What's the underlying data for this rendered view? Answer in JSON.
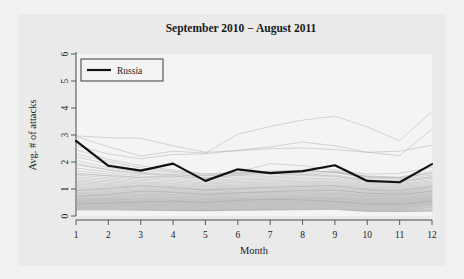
{
  "chart_data": {
    "type": "line",
    "title": "September 2010 − August 2011",
    "xlabel": "Month",
    "ylabel": "Avg. # of attacks",
    "xlim": [
      1,
      12
    ],
    "ylim": [
      0,
      6
    ],
    "xticks": [
      "1",
      "2",
      "3",
      "4",
      "5",
      "6",
      "7",
      "8",
      "9",
      "10",
      "11",
      "12"
    ],
    "yticks": [
      "0",
      "1",
      "2",
      "3",
      "4",
      "5",
      "6"
    ],
    "grid": false,
    "legend": {
      "position": "top-left",
      "entries": [
        {
          "label": "Russia",
          "color": "#111111",
          "width": 2.2
        }
      ]
    },
    "x": [
      1,
      2,
      3,
      4,
      5,
      6,
      7,
      8,
      9,
      10,
      11,
      12
    ],
    "highlight_color": "#111111",
    "background_color": "#eaeaea",
    "plot_background_color": "#f4f4f4",
    "other_series_color": "#9a9a9a",
    "series": [
      {
        "name": "Russia",
        "highlight": true,
        "values": [
          2.78,
          1.86,
          1.68,
          1.94,
          1.3,
          1.73,
          1.59,
          1.66,
          1.88,
          1.3,
          1.25,
          1.92
        ]
      },
      {
        "name": "other-01",
        "highlight": false,
        "values": [
          2.97,
          2.9,
          2.88,
          2.6,
          2.36,
          2.42,
          2.49,
          2.52,
          2.46,
          2.36,
          2.24,
          3.22
        ]
      },
      {
        "name": "other-02",
        "highlight": false,
        "values": [
          2.95,
          2.56,
          2.22,
          2.4,
          2.33,
          3.03,
          3.32,
          3.55,
          3.7,
          3.3,
          2.79,
          3.87
        ]
      },
      {
        "name": "other-03",
        "highlight": false,
        "values": [
          2.6,
          2.3,
          2.12,
          2.28,
          2.3,
          2.43,
          2.56,
          2.74,
          2.6,
          2.36,
          2.4,
          2.62
        ]
      },
      {
        "name": "other-04",
        "highlight": false,
        "values": [
          2.45,
          2.1,
          1.86,
          1.7,
          1.56,
          1.62,
          1.94,
          1.86,
          1.7,
          1.55,
          1.58,
          1.8
        ]
      },
      {
        "name": "other-05",
        "highlight": false,
        "values": [
          2.2,
          1.92,
          1.7,
          1.62,
          1.48,
          1.55,
          1.6,
          1.62,
          1.66,
          1.46,
          1.42,
          1.6
        ]
      },
      {
        "name": "other-06",
        "highlight": false,
        "values": [
          2.05,
          1.8,
          1.62,
          1.55,
          1.42,
          1.5,
          1.52,
          1.55,
          1.6,
          1.4,
          1.36,
          1.52
        ]
      },
      {
        "name": "other-07",
        "highlight": false,
        "values": [
          1.9,
          1.7,
          1.55,
          1.48,
          1.38,
          1.44,
          1.46,
          1.5,
          1.52,
          1.34,
          1.3,
          1.46
        ]
      },
      {
        "name": "other-08",
        "highlight": false,
        "values": [
          1.78,
          1.62,
          1.48,
          1.42,
          1.32,
          1.38,
          1.41,
          1.44,
          1.46,
          1.29,
          1.26,
          1.4
        ]
      },
      {
        "name": "other-09",
        "highlight": false,
        "values": [
          1.68,
          1.55,
          1.42,
          1.36,
          1.27,
          1.33,
          1.36,
          1.38,
          1.4,
          1.24,
          1.21,
          1.35
        ]
      },
      {
        "name": "other-10",
        "highlight": false,
        "values": [
          1.6,
          1.48,
          1.36,
          1.31,
          1.22,
          1.28,
          1.31,
          1.33,
          1.35,
          1.2,
          1.17,
          1.3
        ]
      },
      {
        "name": "other-11",
        "highlight": false,
        "values": [
          1.52,
          1.42,
          1.31,
          1.26,
          1.18,
          1.24,
          1.26,
          1.28,
          1.3,
          1.16,
          1.13,
          1.26
        ]
      },
      {
        "name": "other-12",
        "highlight": false,
        "values": [
          1.45,
          1.36,
          1.26,
          1.21,
          1.14,
          1.19,
          1.22,
          1.24,
          1.26,
          1.12,
          1.09,
          1.22
        ]
      },
      {
        "name": "other-13",
        "highlight": false,
        "values": [
          1.39,
          1.31,
          1.22,
          1.17,
          1.1,
          1.15,
          1.18,
          1.2,
          1.22,
          1.08,
          1.06,
          1.18
        ]
      },
      {
        "name": "other-14",
        "highlight": false,
        "values": [
          1.33,
          1.26,
          1.18,
          1.13,
          1.07,
          1.11,
          1.14,
          1.16,
          1.18,
          1.05,
          1.02,
          1.14
        ]
      },
      {
        "name": "other-15",
        "highlight": false,
        "values": [
          1.28,
          1.21,
          1.14,
          1.09,
          1.03,
          1.08,
          1.1,
          1.12,
          1.14,
          1.01,
          0.99,
          1.11
        ]
      },
      {
        "name": "other-16",
        "highlight": false,
        "values": [
          1.23,
          1.17,
          1.1,
          1.06,
          1.0,
          1.04,
          1.07,
          1.09,
          1.11,
          0.98,
          0.96,
          1.07
        ]
      },
      {
        "name": "other-17",
        "highlight": false,
        "values": [
          1.18,
          1.13,
          1.06,
          1.02,
          0.97,
          1.01,
          1.03,
          1.05,
          1.07,
          0.95,
          0.93,
          1.04
        ]
      },
      {
        "name": "other-18",
        "highlight": false,
        "values": [
          1.13,
          1.09,
          1.03,
          0.99,
          0.94,
          0.98,
          1.0,
          1.02,
          1.04,
          0.92,
          0.9,
          1.01
        ]
      },
      {
        "name": "other-19",
        "highlight": false,
        "values": [
          1.09,
          1.05,
          0.99,
          0.96,
          0.91,
          0.95,
          0.97,
          0.99,
          1.01,
          0.89,
          0.87,
          0.98
        ]
      },
      {
        "name": "other-20",
        "highlight": false,
        "values": [
          1.05,
          1.01,
          0.96,
          0.93,
          0.88,
          0.92,
          0.94,
          0.96,
          0.98,
          0.86,
          0.85,
          0.95
        ]
      },
      {
        "name": "other-21",
        "highlight": false,
        "values": [
          1.01,
          0.98,
          0.93,
          0.9,
          0.85,
          0.89,
          0.91,
          0.93,
          0.95,
          0.84,
          0.82,
          0.92
        ]
      },
      {
        "name": "other-22",
        "highlight": false,
        "values": [
          0.97,
          0.94,
          0.9,
          0.87,
          0.83,
          0.86,
          0.88,
          0.9,
          0.92,
          0.81,
          0.8,
          0.89
        ]
      },
      {
        "name": "other-23",
        "highlight": false,
        "values": [
          0.94,
          0.91,
          0.87,
          0.84,
          0.8,
          0.84,
          0.86,
          0.87,
          0.89,
          0.79,
          0.77,
          0.87
        ]
      },
      {
        "name": "other-24",
        "highlight": false,
        "values": [
          0.9,
          0.88,
          0.84,
          0.81,
          0.78,
          0.81,
          0.83,
          0.85,
          0.86,
          0.76,
          0.75,
          0.84
        ]
      },
      {
        "name": "other-25",
        "highlight": false,
        "values": [
          0.87,
          0.85,
          0.81,
          0.79,
          0.75,
          0.79,
          0.8,
          0.82,
          0.84,
          0.74,
          0.73,
          0.81
        ]
      },
      {
        "name": "other-26",
        "highlight": false,
        "values": [
          0.84,
          0.82,
          0.79,
          0.76,
          0.73,
          0.76,
          0.78,
          0.79,
          0.81,
          0.72,
          0.7,
          0.79
        ]
      },
      {
        "name": "other-27",
        "highlight": false,
        "values": [
          0.81,
          0.79,
          0.76,
          0.74,
          0.71,
          0.74,
          0.75,
          0.77,
          0.79,
          0.7,
          0.68,
          0.77
        ]
      },
      {
        "name": "other-28",
        "highlight": false,
        "values": [
          0.78,
          0.76,
          0.74,
          0.71,
          0.68,
          0.71,
          0.73,
          0.75,
          0.76,
          0.67,
          0.66,
          0.74
        ]
      },
      {
        "name": "other-29",
        "highlight": false,
        "values": [
          0.75,
          0.74,
          0.71,
          0.69,
          0.66,
          0.69,
          0.71,
          0.72,
          0.74,
          0.65,
          0.64,
          0.72
        ]
      },
      {
        "name": "other-30",
        "highlight": false,
        "values": [
          0.72,
          0.71,
          0.69,
          0.67,
          0.64,
          0.67,
          0.68,
          0.7,
          0.71,
          0.63,
          0.62,
          0.7
        ]
      },
      {
        "name": "other-31",
        "highlight": false,
        "values": [
          0.7,
          0.69,
          0.66,
          0.64,
          0.62,
          0.65,
          0.66,
          0.68,
          0.69,
          0.61,
          0.6,
          0.68
        ]
      },
      {
        "name": "other-32",
        "highlight": false,
        "values": [
          0.67,
          0.66,
          0.64,
          0.62,
          0.6,
          0.63,
          0.64,
          0.66,
          0.67,
          0.59,
          0.58,
          0.66
        ]
      },
      {
        "name": "other-33",
        "highlight": false,
        "values": [
          0.65,
          0.64,
          0.62,
          0.6,
          0.58,
          0.61,
          0.62,
          0.64,
          0.65,
          0.57,
          0.56,
          0.64
        ]
      },
      {
        "name": "other-34",
        "highlight": false,
        "values": [
          0.62,
          0.62,
          0.6,
          0.58,
          0.56,
          0.59,
          0.6,
          0.62,
          0.63,
          0.55,
          0.54,
          0.62
        ]
      },
      {
        "name": "other-35",
        "highlight": false,
        "values": [
          0.6,
          0.6,
          0.58,
          0.56,
          0.54,
          0.57,
          0.58,
          0.6,
          0.61,
          0.53,
          0.52,
          0.6
        ]
      },
      {
        "name": "other-36",
        "highlight": false,
        "values": [
          0.58,
          0.58,
          0.56,
          0.54,
          0.52,
          0.55,
          0.56,
          0.58,
          0.59,
          0.51,
          0.5,
          0.58
        ]
      },
      {
        "name": "other-37",
        "highlight": false,
        "values": [
          0.56,
          0.56,
          0.54,
          0.52,
          0.5,
          0.53,
          0.54,
          0.56,
          0.57,
          0.49,
          0.48,
          0.56
        ]
      },
      {
        "name": "other-38",
        "highlight": false,
        "values": [
          0.54,
          0.54,
          0.52,
          0.5,
          0.48,
          0.51,
          0.52,
          0.54,
          0.55,
          0.47,
          0.46,
          0.54
        ]
      },
      {
        "name": "other-39",
        "highlight": false,
        "values": [
          0.52,
          0.52,
          0.5,
          0.48,
          0.46,
          0.49,
          0.5,
          0.52,
          0.53,
          0.45,
          0.44,
          0.52
        ]
      },
      {
        "name": "other-40",
        "highlight": false,
        "values": [
          0.5,
          0.5,
          0.48,
          0.46,
          0.44,
          0.47,
          0.48,
          0.5,
          0.51,
          0.43,
          0.42,
          0.5
        ]
      },
      {
        "name": "other-41",
        "highlight": false,
        "values": [
          0.48,
          0.48,
          0.46,
          0.44,
          0.42,
          0.45,
          0.46,
          0.48,
          0.49,
          0.41,
          0.4,
          0.48
        ]
      },
      {
        "name": "other-42",
        "highlight": false,
        "values": [
          0.46,
          0.46,
          0.44,
          0.42,
          0.4,
          0.43,
          0.44,
          0.46,
          0.47,
          0.39,
          0.38,
          0.46
        ]
      },
      {
        "name": "other-43",
        "highlight": false,
        "values": [
          0.44,
          0.44,
          0.42,
          0.4,
          0.38,
          0.41,
          0.42,
          0.44,
          0.45,
          0.37,
          0.36,
          0.44
        ]
      },
      {
        "name": "other-44",
        "highlight": false,
        "values": [
          0.42,
          0.42,
          0.4,
          0.38,
          0.36,
          0.39,
          0.4,
          0.42,
          0.43,
          0.35,
          0.34,
          0.42
        ]
      },
      {
        "name": "other-45",
        "highlight": false,
        "values": [
          0.4,
          0.4,
          0.38,
          0.36,
          0.34,
          0.37,
          0.38,
          0.4,
          0.41,
          0.33,
          0.32,
          0.4
        ]
      },
      {
        "name": "other-46",
        "highlight": false,
        "values": [
          0.38,
          0.38,
          0.36,
          0.34,
          0.32,
          0.35,
          0.36,
          0.38,
          0.39,
          0.31,
          0.3,
          0.38
        ]
      },
      {
        "name": "other-47",
        "highlight": false,
        "values": [
          0.36,
          0.36,
          0.34,
          0.32,
          0.3,
          0.33,
          0.34,
          0.36,
          0.37,
          0.29,
          0.28,
          0.35
        ]
      },
      {
        "name": "other-48",
        "highlight": false,
        "values": [
          0.34,
          0.34,
          0.32,
          0.3,
          0.28,
          0.31,
          0.32,
          0.34,
          0.35,
          0.27,
          0.26,
          0.32
        ]
      },
      {
        "name": "other-49",
        "highlight": false,
        "values": [
          0.32,
          0.32,
          0.3,
          0.28,
          0.26,
          0.29,
          0.3,
          0.32,
          0.33,
          0.25,
          0.24,
          0.3
        ]
      },
      {
        "name": "other-50",
        "highlight": false,
        "values": [
          0.3,
          0.3,
          0.28,
          0.26,
          0.24,
          0.27,
          0.28,
          0.3,
          0.31,
          0.23,
          0.22,
          0.27
        ]
      },
      {
        "name": "other-51",
        "highlight": false,
        "values": [
          0.28,
          0.28,
          0.26,
          0.24,
          0.22,
          0.25,
          0.26,
          0.28,
          0.29,
          0.21,
          0.2,
          0.24
        ]
      },
      {
        "name": "other-52",
        "highlight": false,
        "values": [
          0.26,
          0.26,
          0.24,
          0.22,
          0.21,
          0.23,
          0.24,
          0.26,
          0.27,
          0.19,
          0.18,
          0.21
        ]
      },
      {
        "name": "other-53",
        "highlight": false,
        "values": [
          0.24,
          0.24,
          0.22,
          0.21,
          0.2,
          0.22,
          0.23,
          0.24,
          0.25,
          0.18,
          0.17,
          0.19
        ]
      },
      {
        "name": "other-54",
        "highlight": false,
        "values": [
          0.22,
          0.22,
          0.21,
          0.2,
          0.19,
          0.21,
          0.22,
          0.23,
          0.24,
          0.17,
          0.16,
          0.18
        ]
      },
      {
        "name": "other-55",
        "highlight": false,
        "values": [
          0.45,
          0.47,
          0.52,
          0.55,
          0.5,
          0.58,
          0.62,
          0.6,
          0.54,
          0.44,
          0.43,
          0.55
        ]
      },
      {
        "name": "other-56",
        "highlight": false,
        "values": [
          1.55,
          1.5,
          1.42,
          1.48,
          1.4,
          1.52,
          1.58,
          1.55,
          1.48,
          1.3,
          1.28,
          1.45
        ]
      },
      {
        "name": "other-57",
        "highlight": false,
        "values": [
          1.95,
          1.72,
          1.58,
          1.52,
          1.5,
          1.58,
          1.64,
          1.7,
          1.62,
          1.44,
          1.4,
          1.58
        ]
      },
      {
        "name": "other-58",
        "highlight": false,
        "values": [
          2.3,
          2.02,
          1.78,
          1.66,
          1.54,
          1.6,
          1.66,
          1.68,
          1.62,
          1.48,
          1.44,
          1.66
        ]
      },
      {
        "name": "other-59",
        "highlight": false,
        "values": [
          0.95,
          1.02,
          1.12,
          1.05,
          0.96,
          1.02,
          1.06,
          1.1,
          1.12,
          0.98,
          0.94,
          1.08
        ]
      },
      {
        "name": "other-60",
        "highlight": false,
        "values": [
          0.72,
          0.8,
          0.92,
          0.88,
          0.8,
          0.86,
          0.9,
          0.94,
          0.96,
          0.84,
          0.8,
          0.92
        ]
      }
    ]
  }
}
